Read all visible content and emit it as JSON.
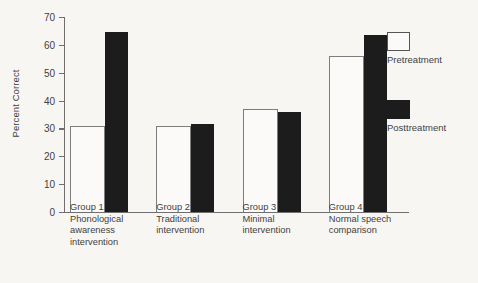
{
  "chart_data": {
    "type": "bar",
    "title": "",
    "xlabel": "",
    "ylabel": "Percent Correct",
    "ylim": [
      0,
      70
    ],
    "yticks": [
      0,
      10,
      20,
      30,
      40,
      50,
      60,
      70
    ],
    "ytick_labels": [
      "0",
      "10",
      "20",
      "30",
      "40",
      "50",
      "60",
      "70"
    ],
    "grid": false,
    "legend_position": "right",
    "categories": [
      "Group 1\nPhonological\nawareness\nintervention",
      "Group 2\nTraditional\nintervention",
      "Group 3\nMinimal\nintervention",
      "Group 4\nNormal speech\ncomparison"
    ],
    "series": [
      {
        "name": "Pretreatment",
        "color": "#ffffff",
        "values": [
          31,
          31,
          37,
          56
        ]
      },
      {
        "name": "Posttreatment",
        "color": "#1c1c1c",
        "values": [
          64.5,
          31.5,
          36,
          63.5
        ]
      }
    ]
  },
  "colors": {
    "background": "#f8f6f3",
    "axis": "#6f6f6f",
    "text": "#3f3f3f",
    "pretreatment_fill": "#fbfaf8",
    "pretreatment_stroke": "#7d7d7d",
    "posttreatment_fill": "#1c1c1c"
  }
}
